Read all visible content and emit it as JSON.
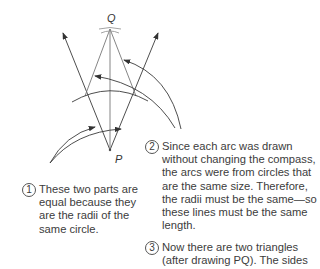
{
  "points": {
    "Q": "Q",
    "P": "P"
  },
  "notes": [
    {
      "number": "1",
      "text": "These two parts are\nequal because they\nare the radii of the\nsame circle."
    },
    {
      "number": "2",
      "text": "Since each arc was drawn\nwithout changing the compass,\nthe arcs were from circles that\nare the same size. Therefore,\nthe radii must be the same—so\nthese lines must be the same\nlength."
    },
    {
      "number": "3",
      "text": "Now there are two triangles\n(after drawing PQ). The sides"
    }
  ],
  "colors": {
    "line": "#3a3a3a",
    "text": "#3c3c3c"
  }
}
